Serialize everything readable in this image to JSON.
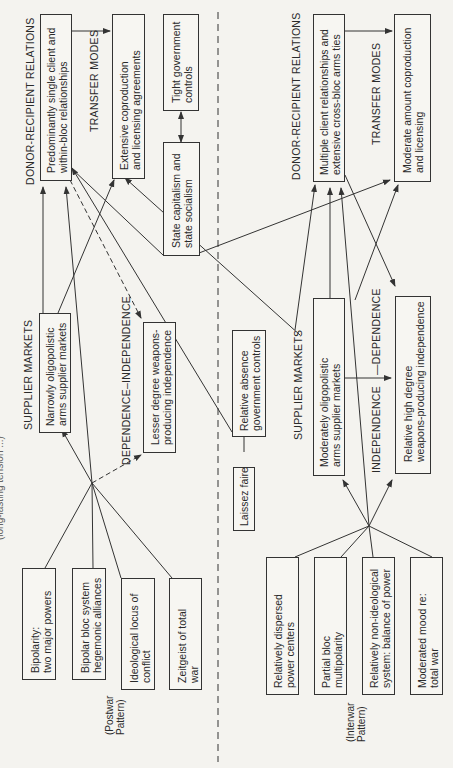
{
  "cut_off_title": "(long-lasting tension ...)",
  "postwar": {
    "pattern_label": [
      "(Postwar",
      "Pattern)"
    ],
    "headings": {
      "donor_recipient": "DONOR-RECIPIENT RELATIONS",
      "transfer_modes": "TRANSFER MODES",
      "supplier_markets": "SUPPLIER MARKETS",
      "dependence": "DEPENDENCE–INDEPENDENCE"
    },
    "boxes": {
      "donor": [
        "Predominantly single client and",
        "within-bloc relationships"
      ],
      "transfer": [
        "Extensive coproduction",
        "and licensing agreements"
      ],
      "tight": [
        "Tight government",
        "controls"
      ],
      "state": [
        "State capitalism and",
        "state socialism"
      ],
      "supplier": [
        "Narrowly oligopolistic",
        "arms supplier markets"
      ],
      "lesser": [
        "Lesser degree weapons-",
        "producing independence"
      ],
      "bipolarity": [
        "Bipolarity:",
        "two major powers"
      ],
      "bloc": [
        "Bipolar bloc system",
        "hegemonic alliances"
      ],
      "ideological": [
        "Ideological locus of",
        "conflict"
      ],
      "zeitgeist": [
        "Zeitgeist of total",
        "war"
      ]
    }
  },
  "interwar": {
    "pattern_label": [
      "(Interwar",
      "Pattern)"
    ],
    "headings": {
      "donor_recipient": "DONOR-RECIPIENT RELATIONS",
      "transfer_modes": "TRANSFER MODES",
      "supplier_markets": "SUPPLIER MARKETS",
      "independence": "INDEPENDENCE",
      "dependence": "—DEPENDENCE"
    },
    "boxes": {
      "donor": [
        "Multiple client relationships and",
        "extensive cross-bloc arms ties"
      ],
      "transfer": [
        "Moderate amount coproduction",
        "and licensing"
      ],
      "absence": [
        "Relative absence",
        "government controls"
      ],
      "laissez": [
        "Laissez faire"
      ],
      "supplier": [
        "Moderately oligopolistic",
        "arms supplier markets"
      ],
      "high": [
        "Relative high degree",
        "weapons-producing independence"
      ],
      "dispersed": [
        "Relatively dispersed",
        "power centers"
      ],
      "partial": [
        "Partial bloc",
        "multipolarity"
      ],
      "nonideo": [
        "Relatively non-ideological",
        "system: balance of power"
      ],
      "moderated": [
        "Moderated mood re:",
        "total war"
      ]
    }
  },
  "colors": {
    "line": "#333333",
    "background": "#f4f3ef"
  }
}
